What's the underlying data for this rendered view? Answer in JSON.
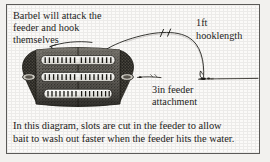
{
  "figure": {
    "type": "fishing-rig-diagram",
    "border_color": "#5b5a57",
    "paper_color": "#fbfaf8",
    "ink_color": "#1d1c1b"
  },
  "annotations": {
    "barbel_note": "Barbel will attack the\nfeeder and hook\nthemselves",
    "hooklength_label": "1ft\nhooklength",
    "attachment_label": "3in feeder\nattachment"
  },
  "caption": {
    "text": "In this diagram, slots are cut in the feeder to allow\nbait to wash out faster when the feeder hits the water."
  },
  "diagram_parts": {
    "feeder_label": "slotted-barrel-feeder",
    "slot_bands": 3,
    "slots_per_band": 16,
    "mainline_label": "mainline",
    "hooklength_label": "hooklength-loop",
    "hook_label": "hook",
    "swivel_label": "swivel",
    "tick_marks": 2
  }
}
